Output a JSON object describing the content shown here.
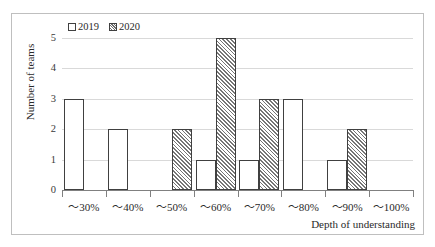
{
  "chart_data": {
    "type": "bar",
    "title": "",
    "xlabel": "Depth of understanding",
    "ylabel": "Number of teams",
    "categories": [
      "〜30%",
      "〜40%",
      "〜50%",
      "〜60%",
      "〜70%",
      "〜80%",
      "〜90%",
      "〜100%"
    ],
    "series": [
      {
        "name": "2019",
        "values": [
          3,
          2,
          0,
          1,
          1,
          3,
          1,
          0
        ],
        "fill": "white",
        "outline": "#404040"
      },
      {
        "name": "2020",
        "values": [
          0,
          0,
          2,
          5,
          3,
          0,
          2,
          0
        ],
        "fill": "diagonal-hatch",
        "outline": "#404040"
      }
    ],
    "ylim": [
      0,
      5
    ],
    "yticks": [
      "0",
      "1",
      "2",
      "3",
      "4",
      "5"
    ],
    "grid": true,
    "legend_position": "top-left"
  },
  "legend": {
    "entries": [
      {
        "label": "2019",
        "swatch": "empty-square-icon"
      },
      {
        "label": "2020",
        "swatch": "hatched-square-icon"
      }
    ]
  },
  "axes": {
    "y_title": "Number of teams",
    "x_title": "Depth of understanding"
  }
}
